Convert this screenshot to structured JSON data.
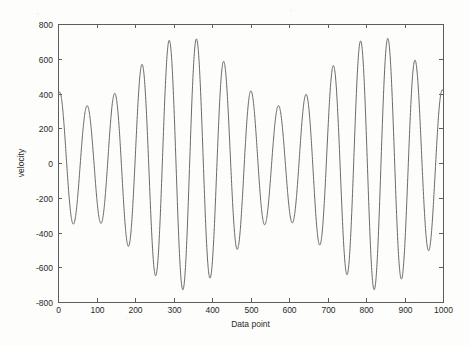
{
  "figure": {
    "background_color": "#fdfdfc",
    "axis_color": "#5d5d5d",
    "curve_color": "#6a6a6a",
    "plot_box": {
      "left": 58,
      "top": 24,
      "right": 443,
      "bottom": 302
    }
  },
  "chart_data": {
    "type": "line",
    "title": "",
    "xlabel": "Data point",
    "ylabel": "velocity",
    "xlim": [
      0,
      1000
    ],
    "ylim": [
      -800,
      800
    ],
    "xticks": [
      0,
      100,
      200,
      300,
      400,
      500,
      600,
      700,
      800,
      900,
      1000
    ],
    "xticklabels": [
      "0",
      "100",
      "200",
      "300",
      "400",
      "500",
      "600",
      "700",
      "800",
      "900",
      "1000"
    ],
    "yticks": [
      -800,
      -600,
      -400,
      -200,
      0,
      200,
      400,
      600,
      800
    ],
    "yticklabels": [
      "-800",
      "-600",
      "-400",
      "-200",
      "0",
      "200",
      "400",
      "600",
      "800"
    ],
    "grid": false,
    "legend": null,
    "box": true,
    "tick_direction": "in",
    "series": [
      {
        "name": "velocity",
        "description": "Amplitude-modulated oscillation (beat pattern): fast sinusoid of period about 71 data points whose envelope swells and shrinks between roughly 330 and 730 units over a beat period of about 500 data points.",
        "oscillation_period": 71,
        "beat_period": 500,
        "envelope_min": 330,
        "envelope_max": 730,
        "carrier_phase_deg": 66,
        "envelope_phase_deg": 214,
        "peaks": [
          {
            "x": 0,
            "y": 530
          },
          {
            "x": 68,
            "y": 365
          },
          {
            "x": 140,
            "y": 325
          },
          {
            "x": 212,
            "y": 440
          },
          {
            "x": 284,
            "y": 610
          },
          {
            "x": 356,
            "y": 720
          },
          {
            "x": 427,
            "y": 680
          },
          {
            "x": 498,
            "y": 520
          },
          {
            "x": 569,
            "y": 370
          },
          {
            "x": 641,
            "y": 335
          },
          {
            "x": 712,
            "y": 445
          },
          {
            "x": 784,
            "y": 615
          },
          {
            "x": 855,
            "y": 725
          },
          {
            "x": 926,
            "y": 685
          },
          {
            "x": 998,
            "y": 540
          }
        ],
        "troughs": [
          {
            "x": 34,
            "y": -610
          },
          {
            "x": 106,
            "y": -720
          },
          {
            "x": 177,
            "y": -685
          },
          {
            "x": 249,
            "y": -525
          },
          {
            "x": 320,
            "y": -370
          },
          {
            "x": 392,
            "y": -335
          },
          {
            "x": 463,
            "y": -440
          },
          {
            "x": 535,
            "y": -615
          },
          {
            "x": 606,
            "y": -725
          },
          {
            "x": 677,
            "y": -685
          },
          {
            "x": 749,
            "y": -525
          },
          {
            "x": 820,
            "y": -370
          },
          {
            "x": 891,
            "y": -330
          },
          {
            "x": 963,
            "y": -435
          }
        ],
        "start_value": 530,
        "end_value": 540,
        "y_max_observed": 725,
        "y_min_observed": -725
      }
    ]
  }
}
